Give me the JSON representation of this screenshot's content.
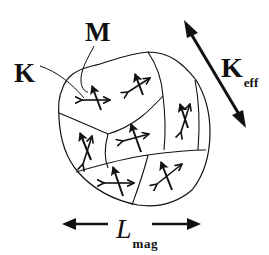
{
  "diagram": {
    "type": "magnetic grain microstructure schematic",
    "labels": {
      "local_anisotropy": "K",
      "magnetization": "M",
      "effective_anisotropy_main": "K",
      "effective_anisotropy_sub": "eff",
      "exchange_length_main": "L",
      "exchange_length_sub": "mag"
    },
    "grain_count": 7,
    "colors": {
      "ink": "#111111",
      "background": "#ffffff"
    }
  }
}
